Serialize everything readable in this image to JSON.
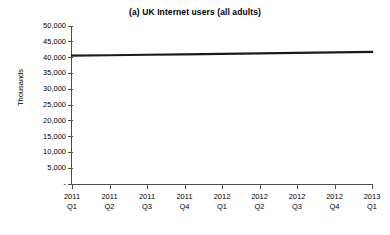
{
  "chart_data": {
    "type": "line",
    "title": "(a) UK Internet users (all adults)",
    "xlabel": "",
    "ylabel": "Thousands",
    "categories": [
      "2011 Q1",
      "2011 Q2",
      "2011 Q3",
      "2011 Q4",
      "2012 Q1",
      "2012 Q2",
      "2012 Q3",
      "2012 Q4",
      "2013 Q1"
    ],
    "category_lines": [
      [
        "2011",
        "Q1"
      ],
      [
        "2011",
        "Q2"
      ],
      [
        "2011",
        "Q3"
      ],
      [
        "2011",
        "Q4"
      ],
      [
        "2012",
        "Q1"
      ],
      [
        "2012",
        "Q2"
      ],
      [
        "2012",
        "Q3"
      ],
      [
        "2012",
        "Q4"
      ],
      [
        "2013",
        "Q1"
      ]
    ],
    "series": [
      {
        "name": "UK Internet users (all adults)",
        "color": "#1a1a1a",
        "values": [
          40600,
          40750,
          40900,
          41050,
          41200,
          41350,
          41500,
          41650,
          41800
        ]
      }
    ],
    "ylim": [
      0,
      50000
    ],
    "ytick_values": [
      0,
      5000,
      10000,
      15000,
      20000,
      25000,
      30000,
      35000,
      40000,
      45000,
      50000
    ],
    "ytick_labels": [
      "-",
      "5,000",
      "10,000",
      "15,000",
      "20,000",
      "25,000",
      "30,000",
      "35,000",
      "40,000",
      "45,000",
      "50,000"
    ],
    "grid": false,
    "legend": false,
    "legend_position": "none"
  }
}
